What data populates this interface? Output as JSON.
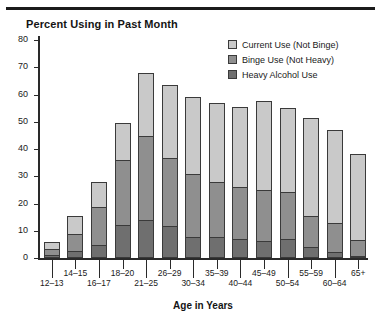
{
  "header": {
    "top_rule": true,
    "faint_header_text": ""
  },
  "chart_title": "Percent Using in Past Month",
  "axis_title_x": "Age in Years",
  "legend": {
    "position": "top-right",
    "items": [
      {
        "label": "Current Use (Not Binge)",
        "swatch": "light-gray-swatch-icon",
        "color": "#c9c9c9"
      },
      {
        "label": "Binge Use (Not Heavy)",
        "swatch": "mid-gray-swatch-icon",
        "color": "#8f8f8f"
      },
      {
        "label": "Heavy Alcohol Use",
        "swatch": "dark-gray-swatch-icon",
        "color": "#6f6f6f"
      }
    ]
  },
  "chart_data": {
    "type": "bar",
    "stacked": true,
    "title": "Percent Using in Past Month",
    "xlabel": "Age in Years",
    "ylabel": "",
    "ylim": [
      0,
      80
    ],
    "yticks": [
      0,
      10,
      20,
      30,
      40,
      50,
      60,
      70,
      80
    ],
    "grid": false,
    "legend_position": "top-right",
    "categories": [
      "12–13",
      "14–15",
      "16–17",
      "18–20",
      "21–25",
      "26–29",
      "30–34",
      "35–39",
      "40–44",
      "45–49",
      "50–54",
      "55–59",
      "60–64",
      "65+"
    ],
    "series": [
      {
        "name": "Heavy Alcohol Use",
        "color": "#6f6f6f",
        "values": [
          1.0,
          2.2,
          4.5,
          12.0,
          13.6,
          11.4,
          7.3,
          7.3,
          6.6,
          5.9,
          6.6,
          3.7,
          1.8,
          0.4
        ]
      },
      {
        "name": "Binge Use (Not Heavy)",
        "color": "#8f8f8f",
        "values": [
          2.4,
          6.5,
          14.5,
          24.0,
          31.4,
          25.3,
          23.7,
          20.7,
          19.4,
          19.1,
          17.4,
          11.7,
          11.0,
          5.8
        ]
      },
      {
        "name": "Current Use (Not Binge)",
        "color": "#c9c9c9",
        "values": [
          2.6,
          6.8,
          9.0,
          13.5,
          23.0,
          26.8,
          28.0,
          29.0,
          29.5,
          32.6,
          31.0,
          36.1,
          34.2,
          31.8
        ]
      }
    ],
    "totals": [
      6.0,
      15.5,
      28.0,
      49.5,
      68.0,
      63.5,
      59.0,
      57.0,
      55.5,
      57.6,
      55.0,
      51.5,
      47.0,
      38.0
    ]
  }
}
